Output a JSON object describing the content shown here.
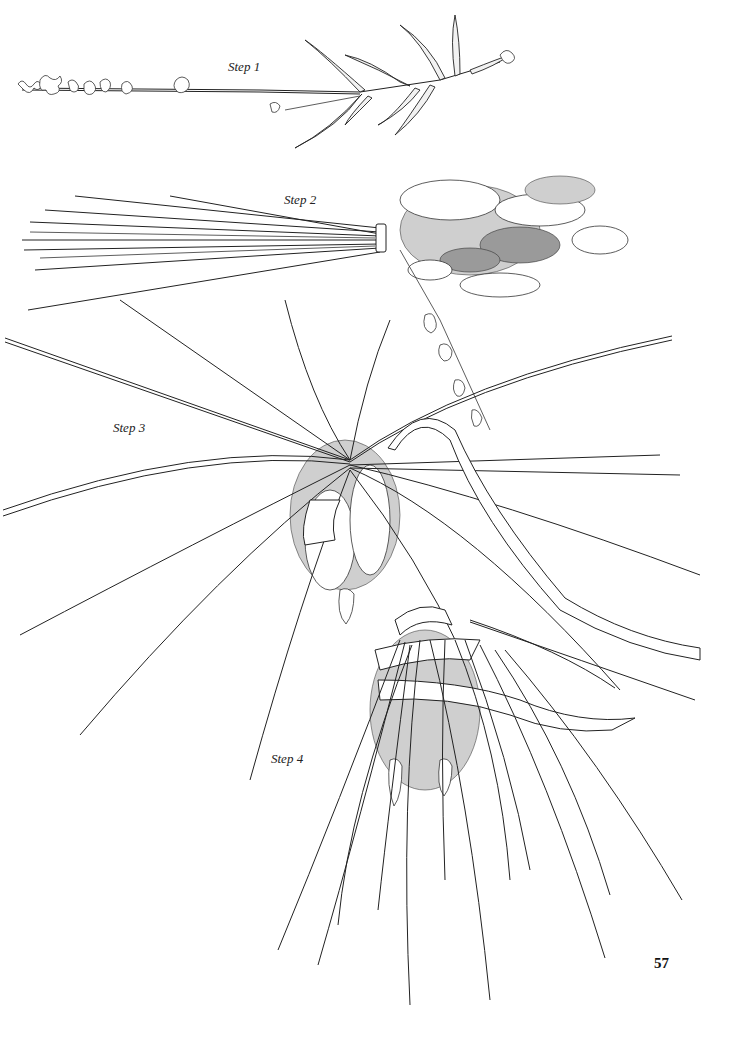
{
  "page": {
    "page_number": "57",
    "background": "#ffffff",
    "ink_color": "#222222"
  },
  "illustration": {
    "subject": "lavender wand making steps",
    "steps": [
      {
        "label": "Step 1",
        "description": "single lavender stem with leaves"
      },
      {
        "label": "Step 2",
        "description": "bundle of stems tied below flower heads"
      },
      {
        "label": "Step 3",
        "description": "stems bent back over flower heads, ribbon inserted"
      },
      {
        "label": "Step 4",
        "description": "ribbon woven through stems around flower heads"
      }
    ]
  }
}
